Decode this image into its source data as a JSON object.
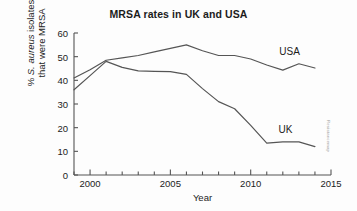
{
  "chart_data": {
    "type": "line",
    "title": "MRSA rates in UK and USA",
    "xlabel": "Year",
    "ylabel_line1": "% S. aureus isolates",
    "ylabel_line2": "that were MRSA",
    "ylabel_italic_part": "S. aureus",
    "xlim": [
      1999,
      2015
    ],
    "ylim": [
      0,
      60
    ],
    "grid": false,
    "legend": "inline-labels",
    "x_major_ticks": [
      2000,
      2005,
      2010,
      2015
    ],
    "x_major_tick_labels": [
      "2000",
      "2005",
      "2010",
      "2015"
    ],
    "x_minor_tick_step": 1,
    "y_ticks": [
      0,
      10,
      20,
      30,
      40,
      50,
      60
    ],
    "y_tick_labels": [
      "0",
      "10",
      "20",
      "30",
      "40",
      "50",
      "60"
    ],
    "series": [
      {
        "name": "USA",
        "color": "#555555",
        "label_text": "USA",
        "x": [
          1999,
          2000,
          2001,
          2002,
          2003,
          2004,
          2005,
          2006,
          2007,
          2008,
          2009,
          2010,
          2011,
          2012,
          2013,
          2014
        ],
        "values": [
          41,
          44.5,
          48.5,
          49.5,
          50.5,
          52,
          53.5,
          55,
          52.5,
          50.5,
          50.5,
          49,
          46.5,
          44.3,
          47,
          45.2
        ]
      },
      {
        "name": "UK",
        "color": "#555555",
        "label_text": "UK",
        "x": [
          1999,
          2000,
          2001,
          2002,
          2003,
          2004,
          2005,
          2006,
          2007,
          2008,
          2009,
          2010,
          2011,
          2012,
          2013,
          2014
        ],
        "values": [
          36,
          42,
          48,
          45.5,
          44,
          43.8,
          43.7,
          42.5,
          36.5,
          31,
          28,
          21,
          13.5,
          14,
          14,
          12
        ]
      }
    ],
    "annotations": [
      {
        "text": "USA",
        "x": 2012.4,
        "y": 51.5
      },
      {
        "text": "UK",
        "x": 2012.1,
        "y": 18.5
      }
    ],
    "watermark": "Resistancemap"
  }
}
